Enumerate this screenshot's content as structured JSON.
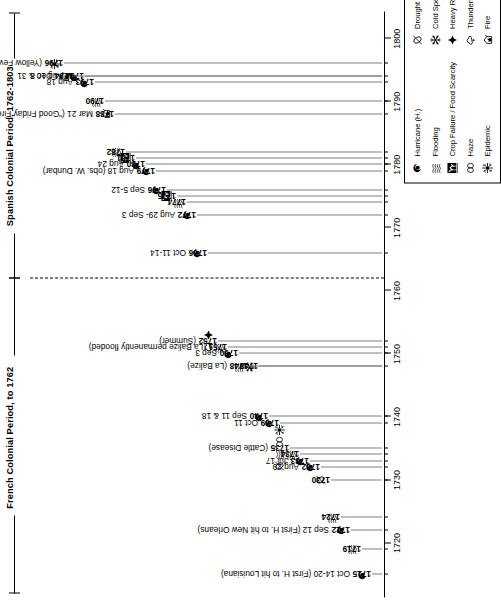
{
  "figure": {
    "orientation": "vertical-timeline-rotated",
    "axis": {
      "label": "Year",
      "min": 1712,
      "max": 1804,
      "ticks": [
        1720,
        1730,
        1740,
        1750,
        1760,
        1770,
        1780,
        1790,
        1800
      ],
      "tick_labels": [
        "1720",
        "1730",
        "1740",
        "1750",
        "1760",
        "1770",
        "1780",
        "1790",
        "1800"
      ],
      "minor_ticks": [
        1715,
        1719,
        1722,
        1724,
        1730,
        1732,
        1733,
        1734,
        1735,
        1739,
        1740,
        1748,
        1750,
        1751,
        1752,
        1766,
        1772,
        1774,
        1775,
        1776,
        1779,
        1780,
        1781,
        1782,
        1788,
        1790,
        1793,
        1794,
        1796
      ]
    },
    "periods": [
      {
        "name": "french",
        "title": "French Colonial Period, to 1762",
        "start": 1712,
        "end": 1762
      },
      {
        "name": "spanish",
        "title": "Spanish Colonial Period, 1762-1803",
        "start": 1762,
        "end": 1804
      }
    ],
    "divider_year": 1762
  },
  "chart_data": {
    "type": "timeline",
    "xlabel": "Year",
    "ylabel": "",
    "xlim": [
      1712,
      1804
    ],
    "grid": false,
    "legend_position": "right",
    "events": [
      {
        "year": 1715,
        "year_label": "1715",
        "detail": "Oct 14-20 (First H. to hit Louisiana)",
        "icons": [
          "hurricane"
        ]
      },
      {
        "year": 1719,
        "year_label": "1719",
        "detail": "",
        "icons": [
          "flooding"
        ]
      },
      {
        "year": 1722,
        "year_label": "1722",
        "detail": "Sep 12 (First H. to hit New Orleans)",
        "icons": [
          "hurricane"
        ]
      },
      {
        "year": 1724,
        "year_label": "1724",
        "detail": "",
        "icons": [
          "flooding"
        ]
      },
      {
        "year": 1730,
        "year_label": "1730",
        "detail": "",
        "icons": [
          "drought"
        ]
      },
      {
        "year": 1732,
        "year_label": "1732",
        "detail": "Aug 29",
        "icons": [
          "hurricane"
        ]
      },
      {
        "year": 1733,
        "year_label": "1733",
        "detail": "Jul 17",
        "icons": [
          "hurricane"
        ]
      },
      {
        "year": 1734,
        "year_label": "1734",
        "detail": "",
        "icons": [
          "flooding"
        ]
      },
      {
        "year": 1735,
        "year_label": "1735",
        "detail": "(Cattle Disease)",
        "icons": [
          "drought",
          "flooding",
          "haze",
          "epidemic"
        ]
      },
      {
        "year": 1739,
        "year_label": "1739",
        "detail": "Oct 11",
        "icons": [
          "hurricane"
        ]
      },
      {
        "year": 1740,
        "year_label": "1740",
        "detail": "Sep 11 & 18",
        "icons": [
          "hurricane"
        ]
      },
      {
        "year": 1748,
        "year_label": "1748",
        "detail": "",
        "icons": [
          "cold-spell"
        ]
      },
      {
        "year": 1748,
        "year_label": "1748",
        "detail": "(La Balize)",
        "icons": [
          "flooding"
        ]
      },
      {
        "year": 1750,
        "year_label": "1750",
        "detail": "Sep 3",
        "icons": [
          "hurricane"
        ]
      },
      {
        "year": 1751,
        "year_label": "1751",
        "detail": "(La Balize permanently flooded)",
        "icons": [
          "flooding"
        ]
      },
      {
        "year": 1752,
        "year_label": "1752",
        "detail": "(Summer)",
        "icons": [
          "thunderstorms",
          "heavy-rain"
        ]
      },
      {
        "year": 1766,
        "year_label": "1766",
        "detail": "Oct 11-14",
        "icons": [
          "hurricane"
        ]
      },
      {
        "year": 1772,
        "year_label": "1772",
        "detail": "Aug 29- Sep 3",
        "icons": [
          "hurricane"
        ]
      },
      {
        "year": 1774,
        "year_label": "1774",
        "detail": "",
        "icons": [
          "flooding"
        ]
      },
      {
        "year": 1775,
        "year_label": "1775",
        "detail": "",
        "icons": [
          "crop-failure"
        ]
      },
      {
        "year": 1776,
        "year_label": "1776",
        "detail": "Sep 5-12",
        "icons": [
          "hurricane"
        ]
      },
      {
        "year": 1779,
        "year_label": "1779",
        "detail": "Aug 18 (obs. W. Dunbar)",
        "icons": [
          "hurricane"
        ]
      },
      {
        "year": 1780,
        "year_label": "1780",
        "detail": "Aug 24",
        "icons": [
          "hurricane"
        ]
      },
      {
        "year": 1781,
        "year_label": "1781",
        "detail": "",
        "icons": [
          "crop-failure"
        ]
      },
      {
        "year": 1782,
        "year_label": "1782",
        "detail": "",
        "icons": [
          "flooding"
        ]
      },
      {
        "year": 1788,
        "year_label": "1788",
        "detail": "Mar 21 (\"Good Friday Fire\")",
        "icons": [
          "fire"
        ]
      },
      {
        "year": 1790,
        "year_label": "1790",
        "detail": "",
        "icons": [
          "flooding"
        ]
      },
      {
        "year": 1793,
        "year_label": "1793",
        "detail": "Aug 18",
        "icons": [
          "hurricane"
        ]
      },
      {
        "year": 1794,
        "year_label": "1794",
        "detail": "Aug 10 & 31",
        "icons": [
          "hurricane"
        ]
      },
      {
        "year": 1794,
        "year_label": "1794",
        "detail": "Dec 8",
        "icons": [
          "fire"
        ]
      },
      {
        "year": 1796,
        "year_label": "1796",
        "detail": "(Yellow Fever)",
        "icons": [
          "epidemic"
        ]
      }
    ]
  },
  "legend": {
    "columns": [
      {
        "items": [
          {
            "icon": "hurricane",
            "label": "Hurricane (H.)"
          },
          {
            "icon": "flooding",
            "label": "Flooding"
          },
          {
            "icon": "crop-failure",
            "label": "Crop Failure / Food Scarcity"
          },
          {
            "icon": "haze",
            "label": "Haze"
          },
          {
            "icon": "epidemic",
            "label": "Epidemic"
          }
        ]
      },
      {
        "items": [
          {
            "icon": "drought",
            "label": "Drought"
          },
          {
            "icon": "cold-spell",
            "label": "Cold Spell"
          },
          {
            "icon": "heavy-rain",
            "label": "Heavy Rain"
          },
          {
            "icon": "thunderstorms",
            "label": "Thunderstorms"
          },
          {
            "icon": "fire",
            "label": "Fire"
          }
        ]
      }
    ]
  },
  "colors": {
    "ink": "#000000",
    "stem": "#808080",
    "background": "#ffffff"
  }
}
